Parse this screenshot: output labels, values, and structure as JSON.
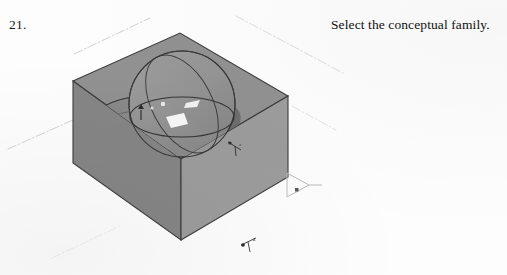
{
  "page": {
    "background_color": "#fdfdfd",
    "width": 507,
    "height": 275
  },
  "step": {
    "number_label": "21.",
    "instruction_text": "Select the conceptual family."
  },
  "viewport": {
    "name": "3d-isometric-view",
    "render_style": "shaded-with-edges",
    "colors": {
      "top_face": "#8f8f8f",
      "left_face": "#828282",
      "right_face": "#9a9a9a",
      "recess_shadow": "#6a6a6a",
      "sphere_light": "#979797",
      "sphere_dark": "#8a8a8a",
      "edge_line": "#3a3a3a",
      "reference_plane_line": "#b9b9b9",
      "highlight_white": "#f6f6f6"
    },
    "geometry": {
      "solids": [
        {
          "name": "host-mass-box",
          "type": "box",
          "shading": "flat-gray"
        },
        {
          "name": "sphere-void",
          "type": "sphere",
          "shading": "shaded-dome"
        },
        {
          "name": "cylinder-void",
          "type": "cylinder",
          "shading": "shaded-disc"
        }
      ],
      "reference_planes": [
        {
          "name": "reference-plane-upper-left",
          "style": "dash-dot"
        },
        {
          "name": "reference-plane-upper-right",
          "style": "dash-dot"
        },
        {
          "name": "reference-plane-left",
          "style": "dash-dot"
        },
        {
          "name": "reference-plane-right",
          "style": "dash-dot"
        }
      ],
      "controls": [
        {
          "name": "flip-arrow-control-right",
          "glyph": "triangle-arrow"
        },
        {
          "name": "shape-handle-top",
          "glyph": "arrow-handle"
        },
        {
          "name": "axis-indicator-bottom",
          "glyph": "xyz-axis"
        },
        {
          "name": "axis-indicator-right",
          "glyph": "xyz-axis"
        }
      ]
    }
  }
}
